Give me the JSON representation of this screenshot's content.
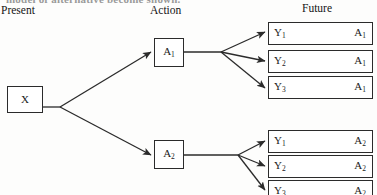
{
  "caption": {
    "truncated_line": "model of alternative become shown."
  },
  "headers": {
    "present": "Present",
    "action": "Action",
    "future": "Future"
  },
  "nodes": {
    "present": {
      "label": "X"
    },
    "actions": [
      {
        "label": "A",
        "subscript": "1"
      },
      {
        "label": "A",
        "subscript": "2"
      }
    ]
  },
  "outcomes": {
    "top_group": [
      {
        "state": "Y",
        "state_sub": "1",
        "action": "A",
        "action_sub": "1"
      },
      {
        "state": "Y",
        "state_sub": "2",
        "action": "A",
        "action_sub": "1"
      },
      {
        "state": "Y",
        "state_sub": "3",
        "action": "A",
        "action_sub": "1"
      }
    ],
    "bottom_group": [
      {
        "state": "Y",
        "state_sub": "1",
        "action": "A",
        "action_sub": "2"
      },
      {
        "state": "Y",
        "state_sub": "2",
        "action": "A",
        "action_sub": "2"
      },
      {
        "state": "Y",
        "state_sub": "3",
        "action": "A",
        "action_sub": "2"
      }
    ]
  },
  "style": {
    "line_color": "#2b2b2b",
    "background": "#fdfdfc"
  }
}
